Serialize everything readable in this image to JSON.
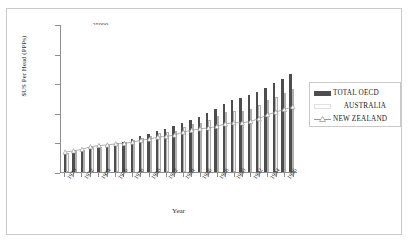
{
  "chart_data": {
    "type": "bar",
    "title": "",
    "xlabel": "Year",
    "ylabel": "$US Per Head (PPPs)",
    "ylim": [
      0,
      25000
    ],
    "yticks": [
      0,
      5000,
      10000,
      15000,
      20000,
      25000
    ],
    "ytick_labels": [
      "0",
      "5000",
      "10000",
      "15000",
      "20000",
      "25000"
    ],
    "grid": false,
    "legend_position": "right",
    "categories": [
      1970,
      1971,
      1972,
      1973,
      1974,
      1975,
      1976,
      1977,
      1978,
      1979,
      1980,
      1981,
      1982,
      1983,
      1984,
      1985,
      1986,
      1987,
      1988,
      1989,
      1990,
      1991,
      1992,
      1993,
      1994,
      1995,
      1996,
      1997
    ],
    "xtick_labels": [
      "1970",
      "1972",
      "1974",
      "1976",
      "1978",
      "1980",
      "1982",
      "1984",
      "1986",
      "1988",
      "1990",
      "1992",
      "1994",
      "1996"
    ],
    "series": [
      {
        "name": "TOTAL  OECD",
        "type": "bar",
        "color": "#4d4d4d",
        "values": [
          3050,
          3350,
          3650,
          4050,
          4200,
          4400,
          4800,
          5100,
          5500,
          6000,
          6450,
          6900,
          7250,
          7700,
          8350,
          8850,
          9300,
          9900,
          10700,
          11450,
          12200,
          12500,
          13000,
          13500,
          14250,
          15050,
          15750,
          16550
        ]
      },
      {
        "name": "AUSTRALIA",
        "type": "bar",
        "color": "#f2f2f2",
        "values": [
          3250,
          3500,
          3800,
          4150,
          4300,
          4500,
          4900,
          5150,
          5400,
          5800,
          6100,
          6600,
          6750,
          7000,
          7600,
          8050,
          8300,
          8750,
          9500,
          10100,
          10350,
          10300,
          10700,
          11300,
          12100,
          12700,
          13350,
          14100
        ]
      },
      {
        "name": "NEW ZEALAND",
        "type": "line",
        "color": "#9a9a9a",
        "marker": "triangle",
        "values": [
          3400,
          3600,
          3850,
          4300,
          4500,
          4600,
          4800,
          4850,
          5100,
          5400,
          5600,
          5950,
          6050,
          6300,
          6800,
          7100,
          7350,
          7500,
          7750,
          8200,
          8400,
          8350,
          8600,
          9100,
          9750,
          10200,
          10650,
          11100
        ]
      }
    ]
  },
  "legend": {
    "items": [
      {
        "label": "TOTAL  OECD",
        "key": "bar-dark"
      },
      {
        "label": "AUSTRALIA",
        "key": "bar-light"
      },
      {
        "label": "NEW ZEALAND",
        "key": "line-triangle"
      }
    ]
  }
}
